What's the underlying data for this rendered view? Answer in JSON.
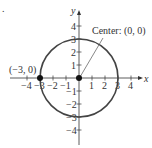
{
  "figure": {
    "stray_mark": ".",
    "axes": {
      "x_label": "x",
      "y_label": "y",
      "x_range": [
        -4,
        4
      ],
      "y_range": [
        -4,
        4
      ],
      "x_ticks": [
        -4,
        -3,
        -2,
        -1,
        1,
        2,
        3,
        4
      ],
      "y_ticks": [
        -4,
        -3,
        -2,
        -1,
        1,
        2,
        3,
        4
      ],
      "x_tick_labels": [
        "−4",
        "−3",
        "−2",
        "−1",
        "1",
        "2",
        "3",
        "4"
      ],
      "y_tick_labels": [
        "−4",
        "−3",
        "−2",
        "−1",
        "1",
        "2",
        "3",
        "4"
      ]
    },
    "circle": {
      "center": [
        0,
        0
      ],
      "radius": 3,
      "color": "#444444"
    },
    "points": [
      {
        "name": "center",
        "x": 0,
        "y": 0
      },
      {
        "name": "left-point",
        "x": -3,
        "y": 0
      }
    ],
    "annotations": {
      "center_label": "Center: (0, 0)",
      "point_label": "(−3, 0)"
    }
  }
}
